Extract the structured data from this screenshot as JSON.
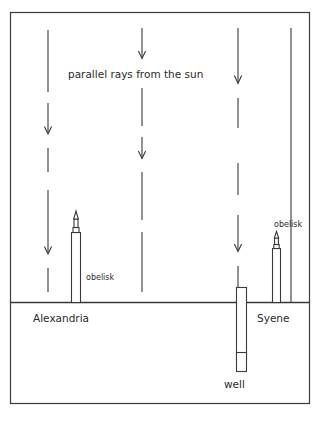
{
  "figure": {
    "kind": "eratosthenes-earth-circumference-diagram",
    "background_color": "#ffffff",
    "ink_color": "#2a2a2a",
    "frame": {
      "x": 10,
      "y": 12,
      "width": 300,
      "height": 392
    },
    "ground": {
      "label": "ground-line",
      "y": 302,
      "x_start": 10,
      "x_end": 310
    }
  },
  "labels": {
    "sun_rays": "parallel rays from the sun",
    "obelisk_left": "obelisk",
    "obelisk_right": "obelisk",
    "city_left": "Alexandria",
    "city_right": "Syene",
    "well": "well"
  },
  "rays": [
    {
      "name": "ray-1",
      "x": 48,
      "top": 30,
      "bottom": 292,
      "arrow_y": [
        132,
        252
      ]
    },
    {
      "name": "ray-2",
      "x": 142,
      "top": 28,
      "bottom": 292,
      "arrow_y": [
        57,
        157
      ]
    },
    {
      "name": "ray-3",
      "x": 238,
      "top": 28,
      "bottom": 292,
      "arrow_y": [
        82,
        250
      ]
    },
    {
      "name": "ray-4",
      "x": 291,
      "top": 28,
      "bottom": 302,
      "arrow_y": []
    }
  ],
  "objects": {
    "obelisk_alexandria": {
      "x": 75,
      "base_y": 302,
      "height": 80,
      "width": 9
    },
    "obelisk_syene": {
      "x": 276,
      "base_y": 302,
      "height": 48,
      "width": 8
    },
    "well": {
      "x": 240,
      "top_y": 287,
      "bottom_y": 372,
      "width": 10
    }
  }
}
